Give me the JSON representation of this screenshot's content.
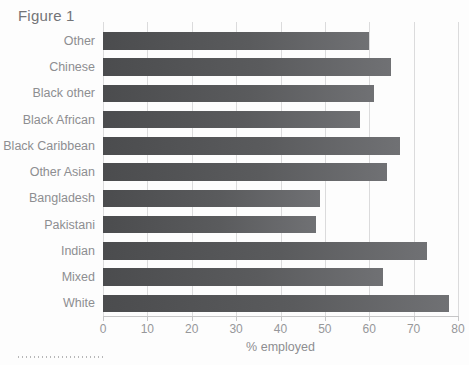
{
  "figure": {
    "title": "Figure 1"
  },
  "chart_data": {
    "type": "bar",
    "orientation": "horizontal",
    "title": "Figure 1",
    "categories": [
      "Other",
      "Chinese",
      "Black other",
      "Black African",
      "Black Caribbean",
      "Other Asian",
      "Bangladesh",
      "Pakistani",
      "Indian",
      "Mixed",
      "White"
    ],
    "values": [
      60,
      65,
      61,
      58,
      67,
      64,
      49,
      48,
      73,
      63,
      78
    ],
    "xlabel": "% employed",
    "ylabel": "",
    "xlim": [
      0,
      80
    ],
    "xticks": [
      0,
      10,
      20,
      30,
      40,
      50,
      60,
      70,
      80
    ],
    "grid": "vertical-gridlines-on",
    "legend": "none",
    "colors": {
      "bar_dark": "#4b4c4e",
      "bar_light": "#707174",
      "gridline": "#dbdbdc",
      "axis_line": "#c6c6c7",
      "category_label": "#8d8e91",
      "tick_label": "#96979a",
      "figure_title": "#737477",
      "background": "#fdfdfd"
    }
  },
  "decorations": {
    "bottom_dotted_rule": "dotted horizontal rule below chart, bottom-left"
  }
}
